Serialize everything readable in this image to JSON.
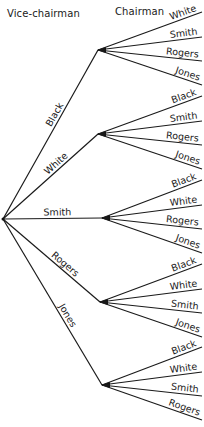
{
  "headers": {
    "vice_chairman": "Vice-chairman",
    "chairman": "Chairman"
  },
  "tree": {
    "root": {
      "x": 3,
      "y": 219
    },
    "candidates": [
      "Black",
      "White",
      "Smith",
      "Rogers",
      "Jones"
    ],
    "branches": [
      {
        "vice_chairman": "Black",
        "node": {
          "x": 98,
          "y": 50
        },
        "chairmen": [
          "White",
          "Smith",
          "Rogers",
          "Jones"
        ]
      },
      {
        "vice_chairman": "White",
        "node": {
          "x": 98,
          "y": 134
        },
        "chairmen": [
          "Black",
          "Smith",
          "Rogers",
          "Jones"
        ]
      },
      {
        "vice_chairman": "Smith",
        "node": {
          "x": 102,
          "y": 218
        },
        "chairmen": [
          "Black",
          "White",
          "Rogers",
          "Jones"
        ]
      },
      {
        "vice_chairman": "Rogers",
        "node": {
          "x": 100,
          "y": 302
        },
        "chairmen": [
          "Black",
          "White",
          "Smith",
          "Jones"
        ]
      },
      {
        "vice_chairman": "Jones",
        "node": {
          "x": 102,
          "y": 385
        },
        "chairmen": [
          "Black",
          "White",
          "Smith",
          "Rogers"
        ]
      }
    ],
    "leaf_x": 202,
    "leaf_dy": [
      -38,
      -13,
      11,
      35
    ]
  },
  "colors": {
    "line": "#1a1a1a",
    "background": "#ffffff"
  }
}
